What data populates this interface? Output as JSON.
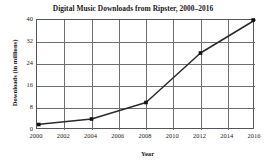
{
  "chart_data": {
    "type": "line",
    "title": "Digital Music Downloads from Ripster, 2000–2016",
    "xlabel": "Year",
    "ylabel": "Downloads (in millions)",
    "x": [
      2000,
      2004,
      2008,
      2012,
      2016
    ],
    "values": [
      2,
      4,
      10,
      28,
      40
    ],
    "series": [
      {
        "name": "Digital Music Downloads",
        "points": [
          {
            "x": 2000,
            "y": 2
          },
          {
            "x": 2004,
            "y": 4
          },
          {
            "x": 2008,
            "y": 10
          },
          {
            "x": 2012,
            "y": 28
          },
          {
            "x": 2016,
            "y": 40
          }
        ]
      }
    ],
    "xlim": [
      2000,
      2016
    ],
    "ylim": [
      0,
      40
    ],
    "xticks": [
      2000,
      2002,
      2004,
      2006,
      2008,
      2010,
      2012,
      2014,
      2016
    ],
    "yticks": [
      0,
      8,
      16,
      24,
      32,
      40
    ],
    "xtick_labels": [
      "2000",
      "2002",
      "2004",
      "2006",
      "2008",
      "2010",
      "2012",
      "2014",
      "2016"
    ],
    "ytick_labels": [
      "0",
      "8",
      "16",
      "24",
      "32",
      "40"
    ],
    "grid": true,
    "legend": false,
    "marker": "square",
    "colors": {
      "line": "#2b2b2b",
      "marker": "#111111",
      "grid": "#6e6e6e",
      "axis": "#555555",
      "background": "#ffffff",
      "text": "#1a1a1a"
    }
  }
}
